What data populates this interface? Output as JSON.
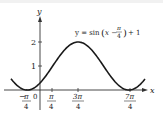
{
  "chart_data": {
    "type": "line",
    "title": "",
    "equation_label": "y = sin(x − π/4) + 1",
    "xlabel": "x",
    "ylabel": "y",
    "x_ticks": [
      "-π/4",
      "0",
      "π/4",
      "3π/4",
      "7π/4"
    ],
    "x_tick_values": [
      -0.7854,
      0,
      0.7854,
      2.3562,
      5.4978
    ],
    "y_ticks": [
      "1",
      "2"
    ],
    "y_tick_values": [
      1,
      2
    ],
    "xlim": [
      -1.2,
      6.1
    ],
    "ylim": [
      -0.6,
      3.2
    ],
    "grid": false,
    "series": [
      {
        "name": "y = sin(x − π/4) + 1",
        "x": [
          -1.18,
          -0.7854,
          0,
          0.7854,
          1.5708,
          2.3562,
          3.1416,
          3.927,
          4.7124,
          5.4978,
          5.89
        ],
        "y": [
          0.08,
          0,
          0.29,
          1,
          1.71,
          2,
          1.71,
          1,
          0.29,
          0,
          0.08
        ]
      }
    ]
  },
  "labels": {
    "y_axis": "y",
    "x_axis": "x",
    "equation_prefix": "y = sin",
    "equation_arg": "x −",
    "equation_frac_num": "π",
    "equation_frac_den": "4",
    "equation_suffix": "+ 1",
    "ytick_1": "1",
    "ytick_2": "2",
    "zero": "0",
    "xt_neg_pi4_num": "π",
    "xt_neg_pi4_den": "4",
    "xt_pi4_num": "π",
    "xt_pi4_den": "4",
    "xt_3pi4_num": "3π",
    "xt_3pi4_den": "4",
    "xt_7pi4_num": "7π",
    "xt_7pi4_den": "4"
  }
}
